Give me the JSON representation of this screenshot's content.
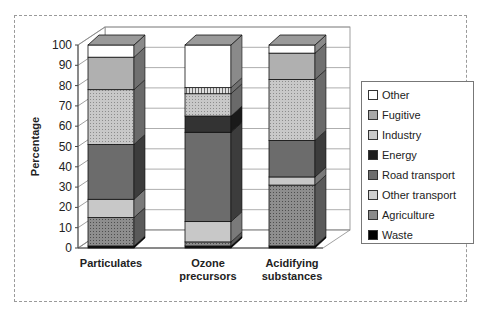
{
  "chart_data": {
    "type": "bar",
    "stacked": true,
    "three_d": true,
    "title": "",
    "xlabel": "",
    "ylabel": "Percentage",
    "ylim": [
      0,
      100
    ],
    "yticks": [
      0,
      10,
      20,
      30,
      40,
      50,
      60,
      70,
      80,
      90,
      100
    ],
    "grid": true,
    "legend_position": "right",
    "categories": [
      "Particulates",
      "Ozone precursors",
      "Acidifying substances"
    ],
    "category_lines": [
      [
        "Particulates"
      ],
      [
        "Ozone",
        "precursors"
      ],
      [
        "Acidifying",
        "substances"
      ]
    ],
    "series": [
      {
        "name": "Waste",
        "values": [
          1,
          1,
          1
        ],
        "color": "#111111"
      },
      {
        "name": "Agriculture",
        "values": [
          14,
          2,
          30
        ],
        "color": "#8a8a8a"
      },
      {
        "name": "Other transport",
        "values": [
          9,
          10,
          4
        ],
        "color": "#c4c4c4"
      },
      {
        "name": "Road transport",
        "values": [
          27,
          44,
          18
        ],
        "color": "#6e6e6e"
      },
      {
        "name": "Energy",
        "values": [
          0,
          8,
          0
        ],
        "color": "#303030"
      },
      {
        "name": "Industry",
        "values": [
          27,
          11,
          30
        ],
        "color": "#b2b2b2"
      },
      {
        "name": "Fugitive",
        "values": [
          16,
          3,
          13
        ],
        "color": "#a6a6a6"
      },
      {
        "name": "Other",
        "values": [
          6,
          21,
          4
        ],
        "color": "#ffffff"
      }
    ]
  },
  "legend": {
    "items": [
      {
        "label": "Other",
        "color": "#ffffff"
      },
      {
        "label": "Fugitive",
        "color": "#a6a6a6"
      },
      {
        "label": "Industry",
        "color": "#c8c8c8"
      },
      {
        "label": "Energy",
        "color": "#1e1e1e"
      },
      {
        "label": "Road transport",
        "color": "#6e6e6e"
      },
      {
        "label": "Other transport",
        "color": "#cfcfcf"
      },
      {
        "label": "Agriculture",
        "color": "#8a8a8a"
      },
      {
        "label": "Waste",
        "color": "#000000"
      }
    ]
  }
}
